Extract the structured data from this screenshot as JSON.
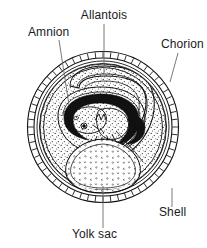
{
  "figure": {
    "background_color": "#ffffff",
    "ink_color": "#111111",
    "leader_color": "#6b6b6b",
    "width": 207,
    "height": 248
  },
  "labels": [
    {
      "id": "allantois",
      "text": "Allantois",
      "x": 104,
      "y": 19,
      "anchor": "middle",
      "leader": {
        "x1": 104,
        "y1": 24,
        "x2": 104,
        "y2": 74
      }
    },
    {
      "id": "amnion",
      "text": "Amnion",
      "x": 28,
      "y": 36,
      "anchor": "start",
      "leader": {
        "x1": 59,
        "y1": 40,
        "x2": 69,
        "y2": 105
      }
    },
    {
      "id": "chorion",
      "text": "Chorion",
      "x": 161,
      "y": 48,
      "anchor": "start",
      "leader": {
        "x1": 178,
        "y1": 53,
        "x2": 170,
        "y2": 82
      }
    },
    {
      "id": "shell",
      "text": "Shell",
      "x": 159,
      "y": 216,
      "anchor": "start",
      "leader": {
        "x1": 172,
        "y1": 188,
        "x2": 172,
        "y2": 207
      }
    },
    {
      "id": "yolk-sac",
      "text": "Yolk sac",
      "x": 72,
      "y": 238,
      "anchor": "start",
      "leader": {
        "x1": 103,
        "y1": 186,
        "x2": 103,
        "y2": 228
      }
    }
  ],
  "structures": {
    "shell": {
      "name": "Shell",
      "center_x": 103,
      "center_y": 127,
      "radius": 75,
      "segments": 60
    },
    "shell_membrane": {
      "name": "Shell membrane",
      "center_x": 103,
      "center_y": 127,
      "radius": 66
    },
    "albumen": {
      "name": "Albumen (stippled)",
      "center_x": 103,
      "center_y": 127,
      "radius": 63
    },
    "chorion": {
      "name": "Chorion",
      "center_x": 103,
      "center_y": 127,
      "radius": 60
    },
    "allantois": {
      "name": "Allantois",
      "description": "Curved sac looping over the embryo"
    },
    "amnion": {
      "name": "Amnion",
      "description": "Membrane enclosing the embryo"
    },
    "embryo": {
      "name": "Embryo",
      "description": "Curled embryo with dark body outline"
    },
    "yolk_sac": {
      "name": "Yolk sac",
      "center_x": 103,
      "center_y": 164,
      "description": "Pear-shaped sac with stippled interior"
    }
  }
}
